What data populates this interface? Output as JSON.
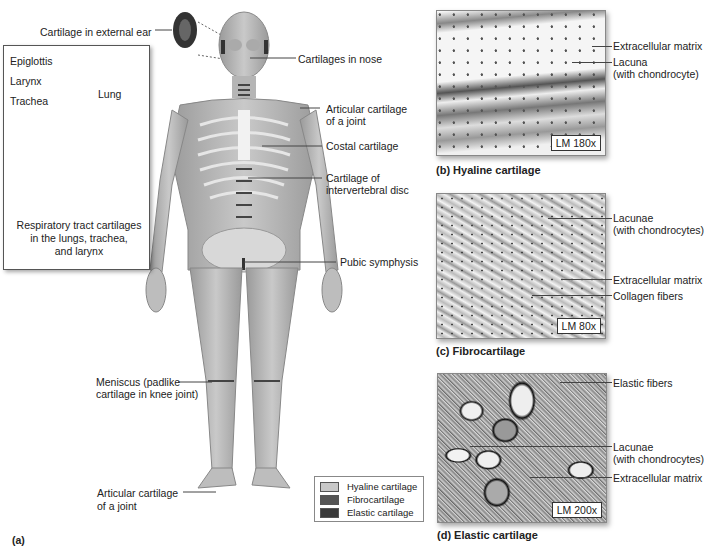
{
  "figure_label": "(a)",
  "body_labels": {
    "external_ear": "Cartilage in external ear",
    "nose": "Cartilages in nose",
    "articular_shoulder": [
      "Articular cartilage",
      "of a joint"
    ],
    "costal": "Costal cartilage",
    "intervertebral": [
      "Cartilage of",
      "intervertebral disc"
    ],
    "pubic": "Pubic symphysis",
    "meniscus": [
      "Meniscus (padlike",
      "cartilage in knee joint)"
    ],
    "articular_ankle": [
      "Articular cartilage",
      "of a joint"
    ]
  },
  "inset": {
    "labels": {
      "epiglottis": "Epiglottis",
      "larynx": "Larynx",
      "trachea": "Trachea",
      "lung": "Lung"
    },
    "caption": [
      "Respiratory tract cartilages",
      "in the lungs, trachea,",
      "and larynx"
    ]
  },
  "legend": {
    "items": [
      {
        "label": "Hyaline cartilage",
        "color": "#c8c8c8"
      },
      {
        "label": "Fibrocartilage",
        "color": "#555555"
      },
      {
        "label": "Elastic cartilage",
        "color": "#3a3a3a"
      }
    ]
  },
  "panels": [
    {
      "id": "b",
      "title": "(b) Hyaline cartilage",
      "magnification": "LM 180x",
      "labels": [
        "Extracellular matrix",
        "Lacuna",
        "(with chondrocyte)"
      ]
    },
    {
      "id": "c",
      "title": "(c) Fibrocartilage",
      "magnification": "LM 80x",
      "labels": [
        "Lacunae",
        "(with chondrocytes)",
        "Extracellular matrix",
        "Collagen fibers"
      ]
    },
    {
      "id": "d",
      "title": "(d) Elastic cartilage",
      "magnification": "LM 200x",
      "labels": [
        "Elastic fibers",
        "Lacunae",
        "(with chondrocytes)",
        "Extracellular matrix"
      ]
    }
  ]
}
